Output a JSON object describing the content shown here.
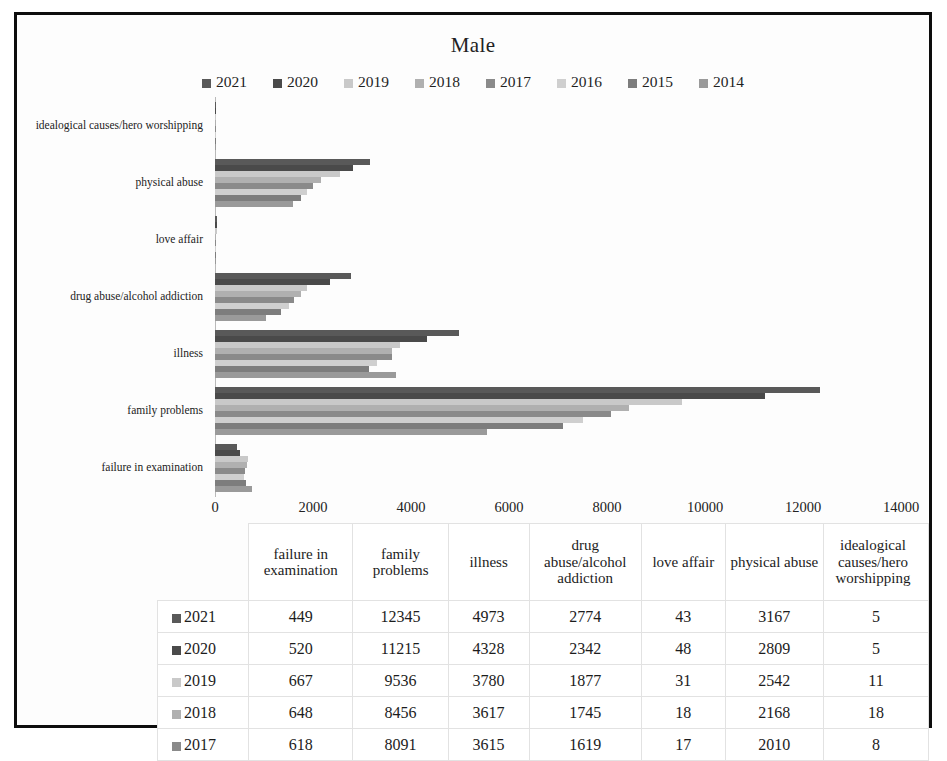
{
  "chart_data": {
    "type": "bar",
    "orientation": "horizontal",
    "title": "Male",
    "xlabel": "",
    "ylabel": "",
    "xlim": [
      0,
      14000
    ],
    "xticks": [
      0,
      2000,
      4000,
      6000,
      8000,
      10000,
      12000,
      14000
    ],
    "xtick_labels": [
      "0",
      "2000",
      "4000",
      "6000",
      "8000",
      "10000",
      "12000",
      "14000"
    ],
    "grid": false,
    "legend_position": "top",
    "categories": [
      "idealogical causes/hero worshipping",
      "physical abuse",
      "love affair",
      "drug abuse/alcohol addiction",
      "illness",
      "family problems",
      "failure in examination"
    ],
    "series": [
      {
        "name": "2021",
        "color": "#595959",
        "values": [
          5,
          3167,
          43,
          2774,
          4973,
          12345,
          449
        ]
      },
      {
        "name": "2020",
        "color": "#4a4a4a",
        "values": [
          5,
          2809,
          48,
          2342,
          4328,
          11215,
          520
        ]
      },
      {
        "name": "2019",
        "color": "#c9c9c9",
        "values": [
          11,
          2542,
          31,
          1877,
          3780,
          9536,
          667
        ]
      },
      {
        "name": "2018",
        "color": "#b0b0b0",
        "values": [
          18,
          2168,
          18,
          1745,
          3617,
          8456,
          648
        ]
      },
      {
        "name": "2017",
        "color": "#8a8a8a",
        "values": [
          8,
          2010,
          17,
          1619,
          3615,
          8091,
          618
        ]
      },
      {
        "name": "2016",
        "color": "#cfcfcf",
        "values": [
          12,
          1870,
          20,
          1500,
          3300,
          7500,
          600
        ]
      },
      {
        "name": "2015",
        "color": "#7d7d7d",
        "values": [
          10,
          1750,
          22,
          1350,
          3150,
          7100,
          640
        ]
      },
      {
        "name": "2014",
        "color": "#9a9a9a",
        "values": [
          9,
          1600,
          25,
          1050,
          3700,
          5550,
          760
        ]
      }
    ]
  },
  "legend": {
    "items": [
      {
        "label": "2021",
        "color": "#595959"
      },
      {
        "label": "2020",
        "color": "#4a4a4a"
      },
      {
        "label": "2019",
        "color": "#c9c9c9"
      },
      {
        "label": "2018",
        "color": "#b0b0b0"
      },
      {
        "label": "2017",
        "color": "#8a8a8a"
      },
      {
        "label": "2016",
        "color": "#cfcfcf"
      },
      {
        "label": "2015",
        "color": "#7d7d7d"
      },
      {
        "label": "2014",
        "color": "#9a9a9a"
      }
    ]
  },
  "table": {
    "corner_label": "",
    "columns": [
      "failure in examination",
      "family problems",
      "illness",
      "drug abuse/alcohol addiction",
      "love affair",
      "physical abuse",
      "idealogical causes/hero worshipping"
    ],
    "rows": [
      {
        "label": "2021",
        "color": "#595959",
        "values": [
          "449",
          "12345",
          "4973",
          "2774",
          "43",
          "3167",
          "5"
        ]
      },
      {
        "label": "2020",
        "color": "#4a4a4a",
        "values": [
          "520",
          "11215",
          "4328",
          "2342",
          "48",
          "2809",
          "5"
        ]
      },
      {
        "label": "2019",
        "color": "#c9c9c9",
        "values": [
          "667",
          "9536",
          "3780",
          "1877",
          "31",
          "2542",
          "11"
        ]
      },
      {
        "label": "2018",
        "color": "#b0b0b0",
        "values": [
          "648",
          "8456",
          "3617",
          "1745",
          "18",
          "2168",
          "18"
        ]
      },
      {
        "label": "2017",
        "color": "#8a8a8a",
        "values": [
          "618",
          "8091",
          "3615",
          "1619",
          "17",
          "2010",
          "8"
        ]
      }
    ]
  }
}
